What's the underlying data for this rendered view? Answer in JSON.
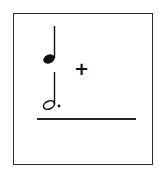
{
  "card": {
    "notes": [
      {
        "type": "quarter-note",
        "icon": "quarter-note-icon"
      },
      {
        "type": "dotted-half-note",
        "icon": "dotted-half-note-icon"
      }
    ],
    "operator": "+",
    "answer_blank": ""
  },
  "colors": {
    "ink": "#111111",
    "border": "#2a2a2a",
    "background": "#ffffff"
  }
}
